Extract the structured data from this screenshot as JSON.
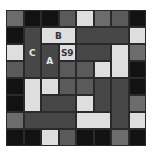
{
  "board": {
    "cols": 8,
    "rows": 8,
    "cell_w": 17.5,
    "cell_h": 17,
    "blocks": [
      {
        "r": 0,
        "c": 0,
        "w": 1,
        "h": 1,
        "color": "mid",
        "label": ""
      },
      {
        "r": 0,
        "c": 1,
        "w": 1,
        "h": 1,
        "color": "black",
        "label": ""
      },
      {
        "r": 0,
        "c": 2,
        "w": 1,
        "h": 1,
        "color": "black",
        "label": ""
      },
      {
        "r": 0,
        "c": 3,
        "w": 1,
        "h": 1,
        "color": "mid2",
        "label": ""
      },
      {
        "r": 0,
        "c": 4,
        "w": 1,
        "h": 1,
        "color": "light",
        "label": ""
      },
      {
        "r": 0,
        "c": 5,
        "w": 1,
        "h": 1,
        "color": "mid",
        "label": ""
      },
      {
        "r": 0,
        "c": 6,
        "w": 1,
        "h": 1,
        "color": "mid2",
        "label": ""
      },
      {
        "r": 0,
        "c": 7,
        "w": 1,
        "h": 1,
        "color": "black",
        "label": ""
      },
      {
        "r": 1,
        "c": 0,
        "w": 1,
        "h": 1,
        "color": "black",
        "label": ""
      },
      {
        "r": 1,
        "c": 1,
        "w": 1,
        "h": 3,
        "color": "dark",
        "label": "C"
      },
      {
        "r": 1,
        "c": 2,
        "w": 2,
        "h": 1,
        "color": "light",
        "label": "B"
      },
      {
        "r": 1,
        "c": 4,
        "w": 3,
        "h": 1,
        "color": "dark",
        "label": ""
      },
      {
        "r": 1,
        "c": 7,
        "w": 1,
        "h": 1,
        "color": "light",
        "label": ""
      },
      {
        "r": 2,
        "c": 0,
        "w": 1,
        "h": 1,
        "color": "light",
        "label": ""
      },
      {
        "r": 2,
        "c": 2,
        "w": 1,
        "h": 2,
        "color": "dark",
        "label": "A"
      },
      {
        "r": 2,
        "c": 3,
        "w": 1,
        "h": 1,
        "color": "light",
        "label": "S9"
      },
      {
        "r": 2,
        "c": 4,
        "w": 2,
        "h": 1,
        "color": "dark",
        "label": ""
      },
      {
        "r": 2,
        "c": 6,
        "w": 1,
        "h": 2,
        "color": "light",
        "label": ""
      },
      {
        "r": 2,
        "c": 7,
        "w": 1,
        "h": 1,
        "color": "mid",
        "label": ""
      },
      {
        "r": 3,
        "c": 0,
        "w": 1,
        "h": 1,
        "color": "mid2",
        "label": ""
      },
      {
        "r": 3,
        "c": 3,
        "w": 1,
        "h": 1,
        "color": "mid2",
        "label": ""
      },
      {
        "r": 3,
        "c": 4,
        "w": 1,
        "h": 1,
        "color": "mid2",
        "label": ""
      },
      {
        "r": 3,
        "c": 5,
        "w": 1,
        "h": 1,
        "color": "light",
        "label": ""
      },
      {
        "r": 3,
        "c": 7,
        "w": 1,
        "h": 1,
        "color": "black",
        "label": ""
      },
      {
        "r": 4,
        "c": 0,
        "w": 1,
        "h": 1,
        "color": "black",
        "label": ""
      },
      {
        "r": 4,
        "c": 1,
        "w": 1,
        "h": 2,
        "color": "light",
        "label": ""
      },
      {
        "r": 4,
        "c": 2,
        "w": 1,
        "h": 1,
        "color": "light",
        "label": ""
      },
      {
        "r": 4,
        "c": 3,
        "w": 1,
        "h": 1,
        "color": "mid2",
        "label": ""
      },
      {
        "r": 4,
        "c": 4,
        "w": 1,
        "h": 1,
        "color": "mid2",
        "label": ""
      },
      {
        "r": 4,
        "c": 5,
        "w": 1,
        "h": 2,
        "color": "dark",
        "label": ""
      },
      {
        "r": 4,
        "c": 6,
        "w": 1,
        "h": 3,
        "color": "dark",
        "label": ""
      },
      {
        "r": 4,
        "c": 7,
        "w": 1,
        "h": 1,
        "color": "black",
        "label": ""
      },
      {
        "r": 5,
        "c": 0,
        "w": 1,
        "h": 1,
        "color": "black",
        "label": ""
      },
      {
        "r": 5,
        "c": 2,
        "w": 2,
        "h": 1,
        "color": "dark",
        "label": ""
      },
      {
        "r": 5,
        "c": 4,
        "w": 1,
        "h": 1,
        "color": "light",
        "label": ""
      },
      {
        "r": 5,
        "c": 7,
        "w": 1,
        "h": 1,
        "color": "mid",
        "label": ""
      },
      {
        "r": 6,
        "c": 0,
        "w": 1,
        "h": 1,
        "color": "mid",
        "label": ""
      },
      {
        "r": 6,
        "c": 1,
        "w": 3,
        "h": 1,
        "color": "dark",
        "label": ""
      },
      {
        "r": 6,
        "c": 4,
        "w": 2,
        "h": 1,
        "color": "light",
        "label": ""
      },
      {
        "r": 6,
        "c": 7,
        "w": 1,
        "h": 1,
        "color": "light",
        "label": ""
      },
      {
        "r": 7,
        "c": 0,
        "w": 1,
        "h": 1,
        "color": "black",
        "label": ""
      },
      {
        "r": 7,
        "c": 1,
        "w": 1,
        "h": 1,
        "color": "black",
        "label": ""
      },
      {
        "r": 7,
        "c": 2,
        "w": 1,
        "h": 1,
        "color": "light",
        "label": ""
      },
      {
        "r": 7,
        "c": 3,
        "w": 1,
        "h": 1,
        "color": "mid2",
        "label": ""
      },
      {
        "r": 7,
        "c": 4,
        "w": 1,
        "h": 1,
        "color": "black",
        "label": ""
      },
      {
        "r": 7,
        "c": 5,
        "w": 1,
        "h": 1,
        "color": "black",
        "label": ""
      },
      {
        "r": 7,
        "c": 6,
        "w": 1,
        "h": 1,
        "color": "mid",
        "label": ""
      },
      {
        "r": 7,
        "c": 7,
        "w": 1,
        "h": 1,
        "color": "black",
        "label": ""
      }
    ]
  }
}
